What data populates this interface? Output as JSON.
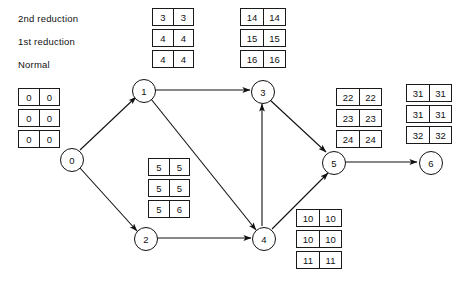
{
  "diagram": {
    "legend": [
      {
        "id": "legend-2nd-reduction",
        "label": "2nd reduction"
      },
      {
        "id": "legend-1st-reduction",
        "label": "1st reduction"
      },
      {
        "id": "legend-normal",
        "label": "Normal"
      }
    ],
    "nodes": [
      {
        "id": "0",
        "label": "0",
        "x": 71,
        "y": 159
      },
      {
        "id": "1",
        "label": "1",
        "x": 143,
        "y": 90
      },
      {
        "id": "2",
        "label": "2",
        "x": 145,
        "y": 238
      },
      {
        "id": "3",
        "label": "3",
        "x": 262,
        "y": 91
      },
      {
        "id": "4",
        "label": "4",
        "x": 263,
        "y": 238
      },
      {
        "id": "5",
        "label": "5",
        "x": 333,
        "y": 162
      },
      {
        "id": "6",
        "label": "6",
        "x": 430,
        "y": 162
      }
    ],
    "edges": [
      {
        "id": "edge-0-1",
        "from": "0",
        "to": "1"
      },
      {
        "id": "edge-0-2",
        "from": "0",
        "to": "2"
      },
      {
        "id": "edge-1-3",
        "from": "1",
        "to": "3"
      },
      {
        "id": "edge-1-4",
        "from": "1",
        "to": "4"
      },
      {
        "id": "edge-2-4",
        "from": "2",
        "to": "4"
      },
      {
        "id": "edge-4-3",
        "from": "4",
        "to": "3"
      },
      {
        "id": "edge-3-5",
        "from": "3",
        "to": "5"
      },
      {
        "id": "edge-4-5",
        "from": "4",
        "to": "5"
      },
      {
        "id": "edge-5-6",
        "from": "5",
        "to": "6"
      }
    ],
    "box_stacks": [
      {
        "id": "legend-key-stack",
        "name": "legend-key-box-stack",
        "x": 152,
        "y": 8,
        "rows": [
          {
            "left": "3",
            "right": "3"
          },
          {
            "left": "4",
            "right": "4"
          },
          {
            "left": "4",
            "right": "4"
          }
        ]
      },
      {
        "id": "node-0-stack",
        "name": "node-0-box-stack",
        "x": 18,
        "y": 88,
        "rows": [
          {
            "left": "0",
            "right": "0"
          },
          {
            "left": "0",
            "right": "0"
          },
          {
            "left": "0",
            "right": "0"
          }
        ]
      },
      {
        "id": "node-3-stack",
        "name": "node-3-box-stack",
        "x": 240,
        "y": 8,
        "rows": [
          {
            "left": "14",
            "right": "14"
          },
          {
            "left": "15",
            "right": "15"
          },
          {
            "left": "16",
            "right": "16"
          }
        ]
      },
      {
        "id": "edge-1-4-stack",
        "name": "activity-1-4-box-stack",
        "x": 148,
        "y": 158,
        "rows": [
          {
            "left": "5",
            "right": "5"
          },
          {
            "left": "5",
            "right": "5"
          },
          {
            "left": "5",
            "right": "6"
          }
        ]
      },
      {
        "id": "node-5-stack",
        "name": "node-5-box-stack",
        "x": 336,
        "y": 88,
        "rows": [
          {
            "left": "22",
            "right": "22"
          },
          {
            "left": "23",
            "right": "23"
          },
          {
            "left": "24",
            "right": "24"
          }
        ]
      },
      {
        "id": "node-6-stack",
        "name": "node-6-box-stack",
        "x": 406,
        "y": 84,
        "rows": [
          {
            "left": "31",
            "right": "31"
          },
          {
            "left": "31",
            "right": "31"
          },
          {
            "left": "32",
            "right": "32"
          }
        ]
      },
      {
        "id": "node-4-stack",
        "name": "node-4-box-stack",
        "x": 296,
        "y": 209,
        "rows": [
          {
            "left": "10",
            "right": "10"
          },
          {
            "left": "10",
            "right": "10"
          },
          {
            "left": "11",
            "right": "11"
          }
        ]
      }
    ],
    "colors": {
      "stroke": "#111111",
      "background": "#ffffff",
      "text": "#111111"
    }
  }
}
